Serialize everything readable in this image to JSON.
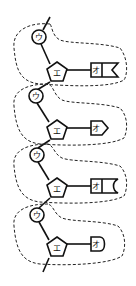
{
  "diagram": {
    "title": "",
    "units": [
      {
        "circle_label": "ウ",
        "pentagon_label": "エ",
        "base_label": "オ",
        "base_shape": "swallowtail-notch"
      },
      {
        "circle_label": "ウ",
        "pentagon_label": "エ",
        "base_label": "オ",
        "base_shape": "arrow-point"
      },
      {
        "circle_label": "ウ",
        "pentagon_label": "エ",
        "base_label": "オ",
        "base_shape": "concave-round"
      },
      {
        "circle_label": "ウ",
        "pentagon_label": "エ",
        "base_label": "オ",
        "base_shape": "rounded-end"
      }
    ],
    "colors": {
      "stroke": "#111111",
      "background": "#ffffff"
    }
  }
}
